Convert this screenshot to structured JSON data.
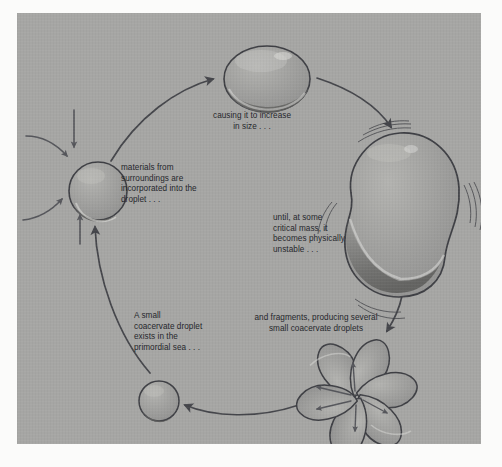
{
  "figure": {
    "background_color": "#a6a6a4",
    "panel_border_color": "#fbfbfa",
    "ink_color": "#3a3b40",
    "text_color": "#24252a",
    "droplet_fill": "#9b9b99",
    "droplet_highlight": "#b4b4b1",
    "droplet_shadow": "#6d6d6b"
  },
  "captions": {
    "materials": "materials from\nsurroundings are\nincorporated into the\ndroplet . . .",
    "increase": "causing it to increase\nin size . . .",
    "unstable": "until, at some\ncritical mass, it\nbecomes physically\nunstable . . .",
    "fragments": "and fragments, producing several\nsmall coacervate droplets",
    "small": "A small\ncoacervate droplet\nexists in the\nprimordial sea . . ."
  },
  "stages": [
    {
      "id": "small-droplet",
      "label": "A small coacervate droplet exists in the primordial sea",
      "shape": "small-circle"
    },
    {
      "id": "absorbing-droplet",
      "label": "materials from surroundings are incorporated into the droplet",
      "shape": "circle"
    },
    {
      "id": "enlarged-droplet",
      "label": "causing it to increase in size",
      "shape": "wide-ellipse"
    },
    {
      "id": "unstable-blob",
      "label": "until, at some critical mass, it becomes physically unstable",
      "shape": "wobbly-blob"
    },
    {
      "id": "fragment-burst",
      "label": "and fragments, producing several small coacervate droplets",
      "shape": "teardrop-burst"
    }
  ],
  "arrows": {
    "cycle_direction": "clockwise",
    "intake_arrow_count": 4,
    "burst_arrow_count": 6
  }
}
